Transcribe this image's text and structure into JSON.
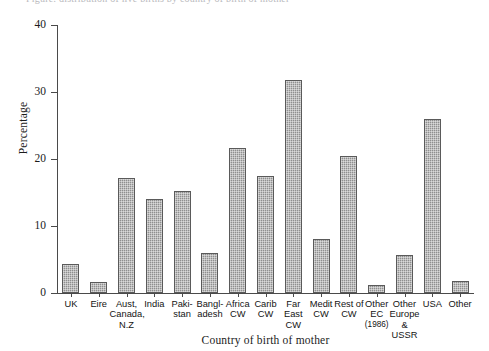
{
  "caption_remnant": "Figure: distribution of live births by country of birth of mother",
  "chart_data": {
    "type": "bar",
    "title": "",
    "xlabel": "Country of birth of mother",
    "ylabel": "Percentage",
    "ylim": [
      0,
      40
    ],
    "yticks": [
      0,
      10,
      20,
      30,
      40
    ],
    "ytick_labels": [
      "0",
      "10",
      "20",
      "30",
      "40"
    ],
    "grid": false,
    "legend": "none",
    "bar_color": "#8f8f8f",
    "bar_edge_color": "#5a5a5a",
    "categories": [
      "UK",
      "Eire",
      "Aust, Canada, N.Z",
      "India",
      "Pakistan",
      "Bangladesh",
      "Africa CW",
      "Carib CW",
      "Far East CW",
      "Medit CW",
      "Rest of CW",
      "Other EC (1986)",
      "Other Europe & USSR",
      "USA",
      "Other"
    ],
    "category_label_lines": [
      [
        "UK"
      ],
      [
        "Eire"
      ],
      [
        "Aust,",
        "Canada,",
        "N.Z"
      ],
      [
        "India"
      ],
      [
        "Paki-",
        "stan"
      ],
      [
        "Bangl-",
        "adesh"
      ],
      [
        "Africa",
        "CW"
      ],
      [
        "Carib",
        "CW"
      ],
      [
        "Far",
        "East",
        "CW"
      ],
      [
        "Medit",
        "CW"
      ],
      [
        "Rest of",
        "CW"
      ],
      [
        "Other",
        "EC",
        "(1986)"
      ],
      [
        "Other",
        "Europe",
        "& USSR"
      ],
      [
        "USA"
      ],
      [
        "Other"
      ]
    ],
    "values": [
      4.3,
      1.6,
      17.1,
      14.0,
      15.2,
      6.0,
      21.7,
      17.5,
      31.8,
      8.1,
      20.5,
      1.2,
      5.7,
      26.0,
      1.8
    ]
  }
}
